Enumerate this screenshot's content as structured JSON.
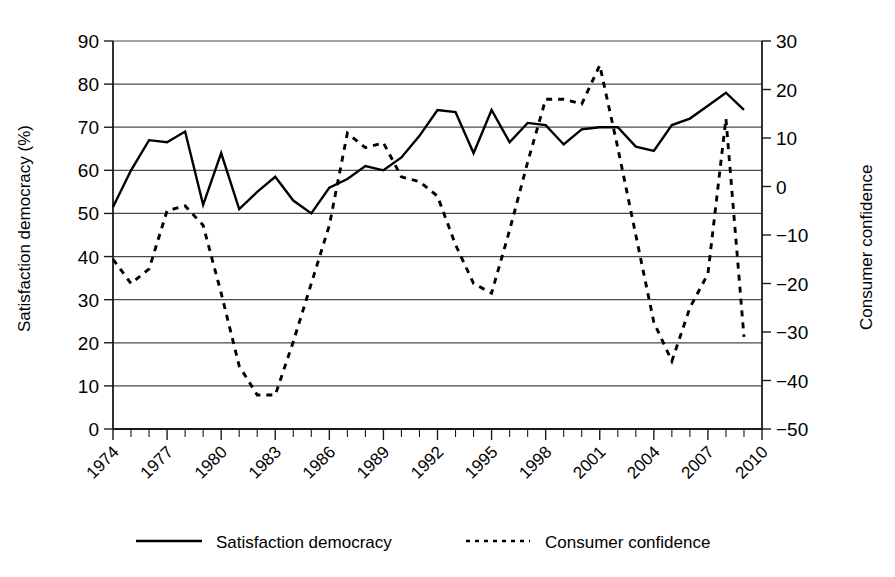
{
  "chart_data": {
    "type": "line",
    "title": "",
    "xlabel": "",
    "ylabel": "Satisfaction democracy (%)",
    "y2label": "Consumer confidence",
    "grid": true,
    "legend_position": "bottom",
    "xlim": [
      1974,
      2010
    ],
    "ylim": [
      0,
      90
    ],
    "y2lim": [
      -50,
      30
    ],
    "xticks": [
      "1974",
      "1977",
      "1980",
      "1983",
      "1986",
      "1989",
      "1992",
      "1995",
      "1998",
      "2001",
      "2004",
      "2007",
      "2010"
    ],
    "yticks": [
      "0",
      "10",
      "20",
      "30",
      "40",
      "50",
      "60",
      "70",
      "80",
      "90"
    ],
    "y2ticks": [
      "-50",
      "-40",
      "-30",
      "-20",
      "-10",
      "0",
      "10",
      "20",
      "30"
    ],
    "x": [
      1974,
      1975,
      1976,
      1977,
      1978,
      1979,
      1980,
      1981,
      1982,
      1983,
      1984,
      1985,
      1986,
      1987,
      1988,
      1989,
      1990,
      1991,
      1992,
      1993,
      1994,
      1995,
      1996,
      1997,
      1998,
      1999,
      2000,
      2001,
      2002,
      2003,
      2004,
      2005,
      2006,
      2007,
      2008,
      2009
    ],
    "series": [
      {
        "name": "Satisfaction democracy",
        "axis": "left",
        "style": "solid",
        "values": [
          51.5,
          60,
          67,
          66.5,
          69,
          52,
          64,
          51,
          55,
          58.5,
          53,
          50,
          56,
          58,
          61,
          60,
          63,
          68,
          74,
          73.5,
          64,
          74,
          66.5,
          71,
          70.5,
          66,
          69.5,
          70,
          70,
          65.5,
          64.5,
          70.5,
          72,
          75,
          78,
          74
        ]
      },
      {
        "name": "Consumer confidence",
        "axis": "right",
        "style": "dashed",
        "values": [
          -15,
          -20,
          -17,
          -5,
          -4,
          -8,
          -22,
          -37,
          -43,
          -43,
          -32,
          -20,
          -8,
          11,
          8,
          9,
          2,
          1,
          -2,
          -12,
          -20,
          -22,
          -9,
          5,
          18,
          18,
          17,
          25,
          8,
          -10,
          -28,
          -36,
          -25,
          -18,
          14,
          -31
        ]
      }
    ],
    "legend": [
      {
        "label": "Satisfaction democracy",
        "style": "solid"
      },
      {
        "label": "Consumer confidence",
        "style": "dashed"
      }
    ]
  }
}
